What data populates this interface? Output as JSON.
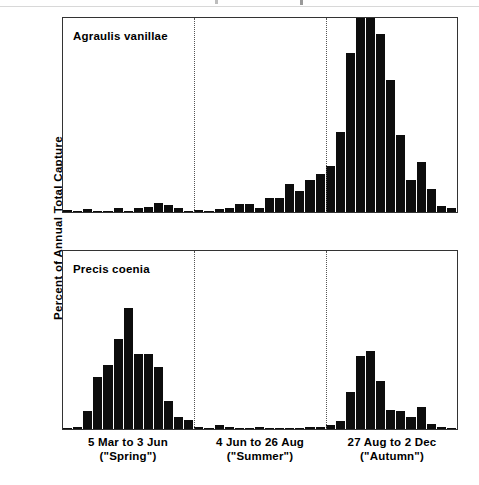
{
  "axis": {
    "y_title": "Percent of Annual Total Capture",
    "y_ticks_major": [
      0,
      5,
      10,
      15
    ],
    "y_tick_labels": [
      "0",
      "5",
      "10",
      "15"
    ],
    "y_min": 0,
    "y_max": 17.8
  },
  "panels": [
    {
      "id": "top",
      "species": "Agraulis vanillae"
    },
    {
      "id": "bottom",
      "species": "Precis coenia"
    }
  ],
  "seasons": [
    {
      "line1": "5 Mar to 3 Jun",
      "line2": "(\"Spring\")"
    },
    {
      "line1": "4 Jun to 26 Aug",
      "line2": "(\"Summer\")"
    },
    {
      "line1": "27 Aug to 2 Dec",
      "line2": "(\"Autumn\")"
    }
  ],
  "colors": {
    "bar": "#0d0d0d",
    "axis": "#333333",
    "divider": "#555555",
    "background": "#ffffff"
  },
  "chart_data": [
    {
      "type": "bar",
      "title": "Agraulis vanillae",
      "xlabel": "",
      "ylabel": "Percent of Annual Total Capture",
      "ylim": [
        0,
        17.8
      ],
      "grid": false,
      "legend": "none",
      "n_bars": 39,
      "season_boundaries": [
        13,
        26
      ],
      "values": [
        0.15,
        0.05,
        0.25,
        0.1,
        0.1,
        0.35,
        0.1,
        0.4,
        0.45,
        0.8,
        0.6,
        0.4,
        0.1,
        0.2,
        0.1,
        0.25,
        0.35,
        0.75,
        0.75,
        0.35,
        1.3,
        1.3,
        2.6,
        1.9,
        2.9,
        3.5,
        4.2,
        7.3,
        14.6,
        19.6,
        24.7,
        16.3,
        12.1,
        7.1,
        2.9,
        4.6,
        2.1,
        0.55,
        0.35
      ]
    },
    {
      "type": "bar",
      "title": "Precis coenia",
      "xlabel": "",
      "ylabel": "Percent of Annual Total Capture",
      "ylim": [
        0,
        17.8
      ],
      "grid": false,
      "legend": "none",
      "n_bars": 39,
      "season_boundaries": [
        13,
        26
      ],
      "values": [
        0.1,
        0.25,
        1.8,
        5.25,
        6.45,
        9.0,
        12.1,
        7.5,
        7.55,
        6.25,
        2.85,
        1.2,
        0.9,
        0.2,
        0.15,
        0.4,
        0.2,
        0.1,
        0.12,
        0.2,
        0.15,
        0.08,
        0.05,
        0.05,
        0.2,
        0.25,
        0.4,
        0.85,
        3.75,
        7.35,
        7.8,
        4.85,
        1.9,
        1.8,
        1.25,
        2.2,
        0.5,
        0.25,
        0.1
      ]
    }
  ]
}
